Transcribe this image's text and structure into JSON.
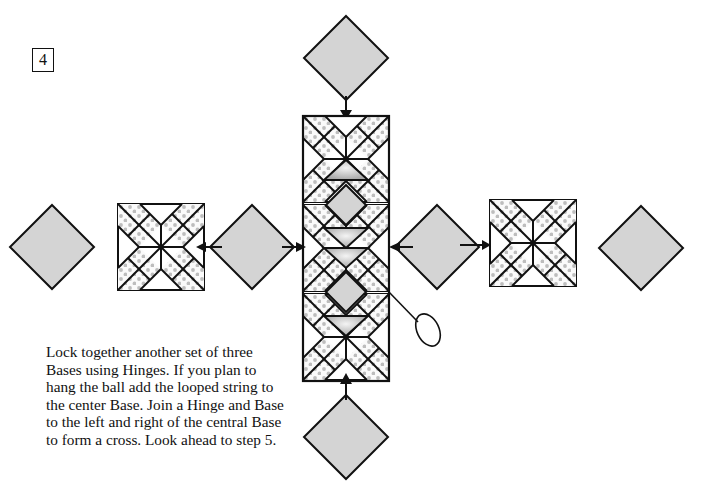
{
  "step": {
    "number": "4"
  },
  "caption": {
    "lines": [
      "Lock together another set of three",
      "Bases using Hinges. If you plan to",
      "hang the ball add the looped string to",
      "the center Base. Join a Hinge and Base",
      "to the left and right of the central Base",
      "to form a cross. Look ahead to step 5."
    ]
  },
  "colors": {
    "line": "#111111",
    "hinge_fill": "#d4d4d4",
    "dot": "#bdbdbd",
    "background": "#ffffff"
  },
  "diagram": {
    "pieces": [
      {
        "type": "hinge",
        "label": "top-hinge"
      },
      {
        "type": "base-column",
        "label": "center-column-three-bases"
      },
      {
        "type": "hinge",
        "label": "bottom-hinge"
      },
      {
        "type": "hinge",
        "label": "left-outer-hinge"
      },
      {
        "type": "base",
        "label": "left-base"
      },
      {
        "type": "hinge",
        "label": "left-inner-hinge"
      },
      {
        "type": "hinge",
        "label": "right-inner-hinge"
      },
      {
        "type": "base",
        "label": "right-base"
      },
      {
        "type": "hinge",
        "label": "right-outer-hinge"
      },
      {
        "type": "looped-string",
        "label": "hanging-loop"
      }
    ]
  }
}
